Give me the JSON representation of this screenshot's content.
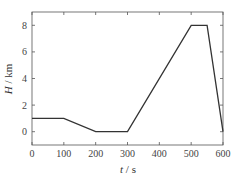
{
  "chart_data": {
    "type": "line",
    "title": "",
    "xlabel": "t / s",
    "ylabel": "H / km",
    "xlabel_italic": "t",
    "xlabel_unit": "s",
    "ylabel_italic": "H",
    "ylabel_unit": "km",
    "xlim": [
      0,
      600
    ],
    "ylim": [
      -1,
      9
    ],
    "xticks": [
      0,
      100,
      200,
      300,
      400,
      500,
      600
    ],
    "yticks": [
      0,
      2,
      4,
      6,
      8
    ],
    "grid": false,
    "legend": null,
    "series": [
      {
        "name": "H",
        "color": "#333333",
        "x": [
          0,
          100,
          200,
          300,
          500,
          550,
          600
        ],
        "y": [
          1,
          1,
          0,
          0,
          8,
          8,
          0
        ]
      }
    ]
  }
}
